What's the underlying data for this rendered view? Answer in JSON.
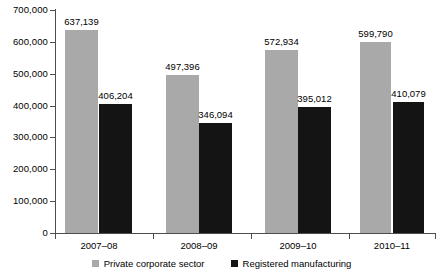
{
  "chart_data": {
    "type": "bar",
    "title": "",
    "subtitle": "",
    "xlabel": "",
    "ylabel": "",
    "categories": [
      "2007–08",
      "2008–09",
      "2009–10",
      "2010–11"
    ],
    "series": [
      {
        "name": "Private corporate sector",
        "color": "#a9a9a9",
        "values": [
          637139,
          497396,
          572934,
          599790
        ],
        "value_labels": [
          "637,139",
          "497,396",
          "572,934",
          "599,790"
        ]
      },
      {
        "name": "Registered manufacturing",
        "color": "#141414",
        "values": [
          406204,
          346094,
          395012,
          410079
        ],
        "value_labels": [
          "406,204",
          "346,094",
          "395,012",
          "410,079"
        ]
      }
    ],
    "ylim": [
      0,
      700000
    ],
    "ytick_values": [
      0,
      100000,
      200000,
      300000,
      400000,
      500000,
      600000,
      700000
    ],
    "ytick_labels": [
      "0",
      "100,000",
      "200,000",
      "300,000",
      "400,000",
      "500,000",
      "600,000",
      "700,000"
    ],
    "grid": false,
    "legend_position": "bottom-center"
  },
  "legend": {
    "items": [
      {
        "label": "Private corporate sector",
        "color": "#a9a9a9"
      },
      {
        "label": "Registered manufacturing",
        "color": "#141414"
      }
    ]
  }
}
